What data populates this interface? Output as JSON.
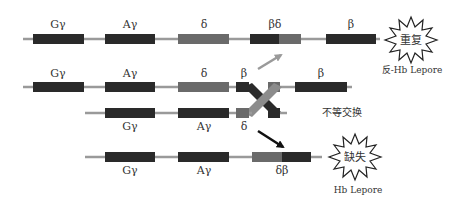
{
  "colors": {
    "line": "#9a9a9a",
    "gene_dark": "#2a2a2a",
    "gene_gray": "#6a6a6a",
    "cross_gray": "#8c8c8c",
    "arrow_gray": "#9a9a9a",
    "arrow_black": "#111111",
    "burst_stroke": "#222222",
    "text": "#333333"
  },
  "rows": [
    {
      "id": "anti-lepore-chromosome",
      "genes": [
        {
          "label": "Gγ",
          "type": "dark"
        },
        {
          "label": "Aγ",
          "type": "dark"
        },
        {
          "label": "δ",
          "type": "gray"
        },
        {
          "label": "βδ",
          "type": "fusion-dark-gray"
        },
        {
          "label": "β",
          "type": "dark"
        }
      ],
      "burst": {
        "text": "重复",
        "caption": "反-Hb Lepore"
      }
    },
    {
      "id": "parental-chromosome-top",
      "genes": [
        {
          "label": "Gγ",
          "type": "dark"
        },
        {
          "label": "Aγ",
          "type": "dark"
        },
        {
          "label": "δ",
          "type": "gray"
        },
        {
          "label": "β",
          "type": "dark-partial"
        },
        {
          "label": "β",
          "type": "dark"
        }
      ]
    },
    {
      "id": "parental-chromosome-bottom",
      "genes": [
        {
          "label": "Gγ",
          "type": "dark"
        },
        {
          "label": "Aγ",
          "type": "dark"
        },
        {
          "label": "δ",
          "type": "gray-partial"
        }
      ],
      "annotation": "不等交换"
    },
    {
      "id": "lepore-chromosome",
      "genes": [
        {
          "label": "Gγ",
          "type": "dark"
        },
        {
          "label": "Aγ",
          "type": "dark"
        },
        {
          "label": "δβ",
          "type": "fusion-gray-dark"
        }
      ],
      "burst": {
        "text": "缺失",
        "caption": "Hb Lepore"
      }
    }
  ]
}
